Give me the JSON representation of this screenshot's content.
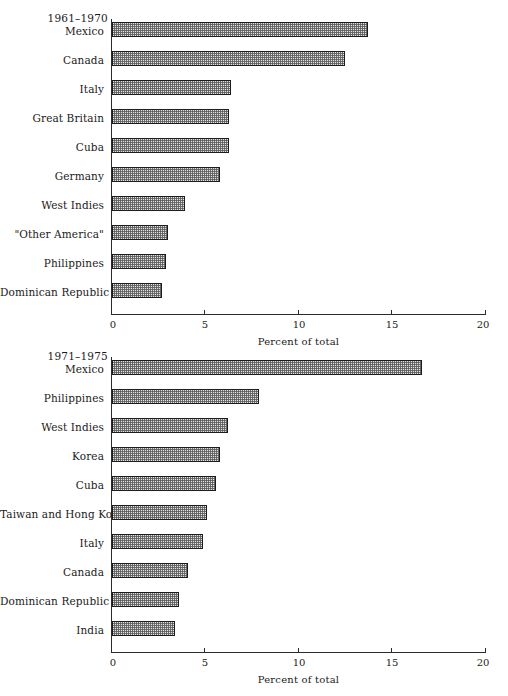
{
  "chart_data": [
    {
      "type": "bar",
      "orientation": "horizontal",
      "title": "1961–1970",
      "xlabel": "Percent of total",
      "ylabel": "",
      "xlim": [
        0,
        20
      ],
      "xticks": [
        0,
        5,
        10,
        15,
        20
      ],
      "xticklabels": [
        "0",
        "5",
        "10",
        "15",
        "20"
      ],
      "grid": false,
      "legend": "none",
      "categories": [
        "Mexico",
        "Canada",
        "Italy",
        "Great Britain",
        "Cuba",
        "Germany",
        "West Indies",
        "\"Other America\"",
        "Philippines",
        "Dominican Republic"
      ],
      "values": [
        13.7,
        12.5,
        6.4,
        6.3,
        6.3,
        5.8,
        3.9,
        3.0,
        2.9,
        2.7
      ]
    },
    {
      "type": "bar",
      "orientation": "horizontal",
      "title": "1971–1975",
      "xlabel": "Percent of total",
      "ylabel": "",
      "xlim": [
        0,
        20
      ],
      "xticks": [
        0,
        5,
        10,
        15,
        20
      ],
      "xticklabels": [
        "0",
        "5",
        "10",
        "15",
        "20"
      ],
      "grid": false,
      "legend": "none",
      "categories": [
        "Mexico",
        "Philippines",
        "West Indies",
        "Korea",
        "Cuba",
        "Taiwan and Hong Kong",
        "Italy",
        "Canada",
        "Dominican Republic",
        "India"
      ],
      "values": [
        16.6,
        7.9,
        6.2,
        5.8,
        5.6,
        5.1,
        4.9,
        4.1,
        3.6,
        3.4
      ]
    }
  ]
}
